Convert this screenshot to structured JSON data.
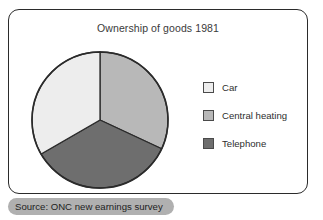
{
  "figure": {
    "title": "Ownership of goods 1981",
    "source_caption": "Source: ONC new earnings survey"
  },
  "legend": {
    "items": [
      {
        "label": "Car",
        "color": "#ededed"
      },
      {
        "label": "Central heating",
        "color": "#b8b8b8"
      },
      {
        "label": "Telephone",
        "color": "#6e6e6e"
      }
    ]
  },
  "chart_data": {
    "type": "pie",
    "title": "Ownership of goods 1981",
    "xlabel": "",
    "ylabel": "",
    "categories": [
      "Car",
      "Central heating",
      "Telephone"
    ],
    "values": [
      33.3,
      32.0,
      34.7
    ],
    "unit": "percent",
    "slice_angles_deg": [
      120,
      115,
      125
    ],
    "start_angle_deg": 0,
    "direction": "clockwise",
    "colors": [
      "#ededed",
      "#b8b8b8",
      "#6e6e6e"
    ],
    "slice_border_color": "#2b2b2b",
    "labels_shown": false,
    "grid": false,
    "legend_position": "right",
    "annotations": [
      "Source: ONC new earnings survey"
    ]
  }
}
